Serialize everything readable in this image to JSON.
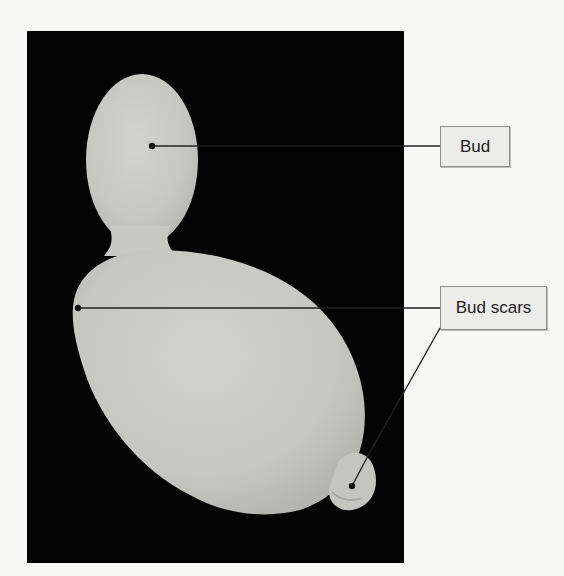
{
  "figure": {
    "colors": {
      "background": "#f7f7f6",
      "photo_background": "#030303",
      "cell": "#c9c9c6",
      "label_fill": "#ececeb",
      "label_border": "#8f8f8f",
      "leader_line": "#222222"
    }
  },
  "labels": [
    {
      "id": "bud",
      "text": "Bud"
    },
    {
      "id": "bud-scars",
      "text": "Bud scars"
    }
  ]
}
